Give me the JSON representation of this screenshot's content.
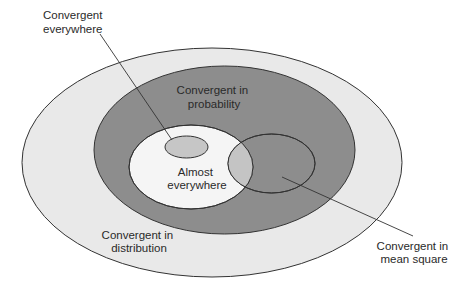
{
  "diagram": {
    "type": "nested-venn",
    "colors": {
      "distribution_fill": "#e9e9e9",
      "probability_fill": "#8d8d8d",
      "almost_everywhere_fill": "#f5f5f5",
      "everywhere_fill": "#c6c6c6",
      "mean_square_fill": "#8d8d8d",
      "overlap_fill": "#c4c4c4",
      "stroke": "#333333",
      "text": "#2a2a2a"
    },
    "sets": [
      {
        "id": "distribution",
        "label_lines": [
          "Convergent in",
          "distribution"
        ],
        "contains": [
          "probability"
        ]
      },
      {
        "id": "probability",
        "label_lines": [
          "Convergent in",
          "probability"
        ],
        "contains": [
          "almost_everywhere",
          "mean_square"
        ]
      },
      {
        "id": "almost_everywhere",
        "label_lines": [
          "Almost",
          "everywhere"
        ],
        "contains": [
          "everywhere"
        ]
      },
      {
        "id": "everywhere",
        "label_lines": [
          "Convergent",
          "everywhere"
        ],
        "callout": true
      },
      {
        "id": "mean_square",
        "label_lines": [
          "Convergent in",
          "mean square"
        ],
        "callout": true,
        "overlaps": [
          "almost_everywhere"
        ]
      }
    ]
  }
}
